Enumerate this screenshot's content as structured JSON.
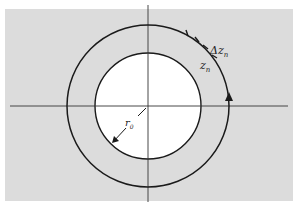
{
  "figure": {
    "colors": {
      "background": "#ffffff",
      "region_fill": "#dcdcdc",
      "inner_disk": "#ffffff",
      "stroke": "#1a1a1a"
    },
    "labels": {
      "delta": "Δz",
      "delta_sub": "n",
      "zn": "z",
      "zn_sub": "n",
      "radius": "r",
      "radius_sub": "0"
    },
    "geometry": {
      "center": [
        148,
        106
      ],
      "outer_radius": 81,
      "inner_radius": 53
    }
  }
}
